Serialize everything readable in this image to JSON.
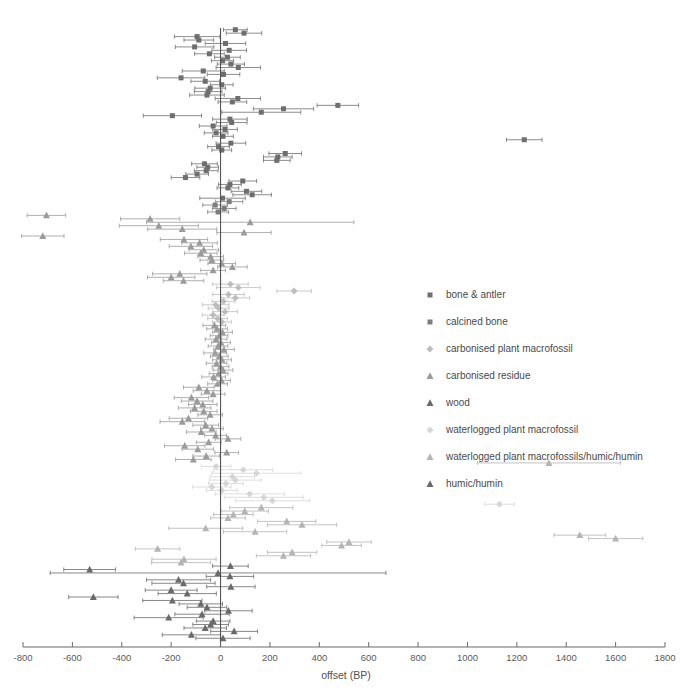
{
  "chart_data": {
    "type": "scatter",
    "title": "",
    "subtitle": "",
    "xlabel": "offset (BP)",
    "ylabel": "",
    "xlim": [
      -800,
      1800
    ],
    "ylim": [
      0,
      190
    ],
    "grid": false,
    "orientation": "forest-plot-horizontal-error-bars",
    "reference_line": {
      "x": 0,
      "label": "zero offset"
    },
    "xticks": [
      -800,
      -600,
      -400,
      -200,
      0,
      200,
      400,
      600,
      800,
      1000,
      1200,
      1400,
      1600,
      1800
    ],
    "xtick_labels": [
      "-800",
      "-600",
      "-400",
      "-200",
      "0",
      "200",
      "400",
      "600",
      "800",
      "1000",
      "1200",
      "1400",
      "1600",
      "1800"
    ],
    "legend_position": "right-middle",
    "series": [
      {
        "name": "bone & antler",
        "marker": "square",
        "color": "#6e6e6e"
      },
      {
        "name": "calcined bone",
        "marker": "square",
        "color": "#7d7d7d"
      },
      {
        "name": "carbonised plant macrofossil",
        "marker": "diamond",
        "color": "#bdbdbd"
      },
      {
        "name": "carbonised residue",
        "marker": "triangle",
        "color": "#9b9b9b"
      },
      {
        "name": "wood",
        "marker": "triangle",
        "color": "#6a6a6a"
      },
      {
        "name": "waterlogged plant macrofossil",
        "marker": "diamond",
        "color": "#d5d5d5"
      },
      {
        "name": "waterlogged plant macrofossils/humic/humin",
        "marker": "triangle",
        "color": "#b4b4b4"
      },
      {
        "name": "humic/humin",
        "marker": "triangle",
        "color": "#6a6a6a"
      }
    ],
    "points": [
      {
        "x": 60,
        "err": 48,
        "s": 0
      },
      {
        "x": 95,
        "err": 72,
        "s": 0
      },
      {
        "x": -95,
        "err": 92,
        "s": 0
      },
      {
        "x": -88,
        "err": 60,
        "s": 0
      },
      {
        "x": 20,
        "err": 82,
        "s": 0
      },
      {
        "x": -105,
        "err": 78,
        "s": 0
      },
      {
        "x": 35,
        "err": 70,
        "s": 0
      },
      {
        "x": -45,
        "err": 60,
        "s": 0
      },
      {
        "x": 28,
        "err": 52,
        "s": 0
      },
      {
        "x": 8,
        "err": 45,
        "s": 0
      },
      {
        "x": 42,
        "err": 55,
        "s": 0
      },
      {
        "x": 72,
        "err": 90,
        "s": 0
      },
      {
        "x": -70,
        "err": 85,
        "s": 0
      },
      {
        "x": 12,
        "err": 66,
        "s": 0
      },
      {
        "x": -160,
        "err": 96,
        "s": 0
      },
      {
        "x": -62,
        "err": 58,
        "s": 0
      },
      {
        "x": 5,
        "err": 46,
        "s": 0
      },
      {
        "x": -42,
        "err": 62,
        "s": 0
      },
      {
        "x": -50,
        "err": 56,
        "s": 0
      },
      {
        "x": -55,
        "err": 70,
        "s": 0
      },
      {
        "x": 70,
        "err": 92,
        "s": 0
      },
      {
        "x": 48,
        "err": 58,
        "s": 0
      },
      {
        "x": 475,
        "err": 84,
        "s": 0
      },
      {
        "x": 255,
        "err": 122,
        "s": 0
      },
      {
        "x": 165,
        "err": 160,
        "s": 0
      },
      {
        "x": -195,
        "err": 118,
        "s": 0
      },
      {
        "x": 38,
        "err": 70,
        "s": 0
      },
      {
        "x": 45,
        "err": 62,
        "s": 0
      },
      {
        "x": -30,
        "err": 56,
        "s": 0
      },
      {
        "x": 18,
        "err": 50,
        "s": 0
      },
      {
        "x": -18,
        "err": 48,
        "s": 0
      },
      {
        "x": 10,
        "err": 42,
        "s": 0
      },
      {
        "x": 1230,
        "err": 72,
        "s": 0
      },
      {
        "x": 42,
        "err": 60,
        "s": 0
      },
      {
        "x": -8,
        "err": 44,
        "s": 0
      },
      {
        "x": 5,
        "err": 40,
        "s": 0
      },
      {
        "x": 262,
        "err": 66,
        "s": 0
      },
      {
        "x": 232,
        "err": 58,
        "s": 0
      },
      {
        "x": 228,
        "err": 54,
        "s": 0
      },
      {
        "x": -65,
        "err": 52,
        "s": 0
      },
      {
        "x": -52,
        "err": 44,
        "s": 0
      },
      {
        "x": -58,
        "err": 48,
        "s": 0
      },
      {
        "x": -95,
        "err": 46,
        "s": 0
      },
      {
        "x": -142,
        "err": 58,
        "s": 0
      },
      {
        "x": 90,
        "err": 56,
        "s": 0
      },
      {
        "x": 38,
        "err": 46,
        "s": 0
      },
      {
        "x": 30,
        "err": 44,
        "s": 0
      },
      {
        "x": 105,
        "err": 62,
        "s": 0
      },
      {
        "x": 128,
        "err": 78,
        "s": 0
      },
      {
        "x": 8,
        "err": 92,
        "s": 0
      },
      {
        "x": 35,
        "err": 55,
        "s": 1
      },
      {
        "x": -22,
        "err": 50,
        "s": 1
      },
      {
        "x": 15,
        "err": 48,
        "s": 1
      },
      {
        "x": -10,
        "err": 42,
        "s": 1
      },
      {
        "x": -705,
        "err": 78,
        "s": 3
      },
      {
        "x": -285,
        "err": 120,
        "s": 3
      },
      {
        "x": 120,
        "err": 420,
        "s": 3
      },
      {
        "x": -250,
        "err": 160,
        "s": 3
      },
      {
        "x": -155,
        "err": 140,
        "s": 3
      },
      {
        "x": 95,
        "err": 110,
        "s": 3
      },
      {
        "x": -720,
        "err": 86,
        "s": 3
      },
      {
        "x": -148,
        "err": 96,
        "s": 3
      },
      {
        "x": -85,
        "err": 72,
        "s": 3
      },
      {
        "x": -120,
        "err": 88,
        "s": 3
      },
      {
        "x": -68,
        "err": 60,
        "s": 3
      },
      {
        "x": -80,
        "err": 66,
        "s": 3
      },
      {
        "x": -40,
        "err": 52,
        "s": 3
      },
      {
        "x": -35,
        "err": 48,
        "s": 3
      },
      {
        "x": 5,
        "err": 56,
        "s": 3
      },
      {
        "x": 48,
        "err": 60,
        "s": 3
      },
      {
        "x": -30,
        "err": 50,
        "s": 3
      },
      {
        "x": -165,
        "err": 110,
        "s": 3
      },
      {
        "x": -200,
        "err": 96,
        "s": 3
      },
      {
        "x": -150,
        "err": 82,
        "s": 3
      },
      {
        "x": 40,
        "err": 72,
        "s": 2
      },
      {
        "x": 72,
        "err": 88,
        "s": 2
      },
      {
        "x": 298,
        "err": 70,
        "s": 2
      },
      {
        "x": 32,
        "err": 64,
        "s": 2
      },
      {
        "x": 60,
        "err": 58,
        "s": 2
      },
      {
        "x": 12,
        "err": 46,
        "s": 2
      },
      {
        "x": -20,
        "err": 54,
        "s": 2
      },
      {
        "x": -8,
        "err": 42,
        "s": 2
      },
      {
        "x": 18,
        "err": 50,
        "s": 2
      },
      {
        "x": -30,
        "err": 44,
        "s": 2
      },
      {
        "x": -12,
        "err": 40,
        "s": 2
      },
      {
        "x": 5,
        "err": 38,
        "s": 2
      },
      {
        "x": -25,
        "err": 46,
        "s": 3
      },
      {
        "x": -14,
        "err": 42,
        "s": 3
      },
      {
        "x": 8,
        "err": 40,
        "s": 3
      },
      {
        "x": -6,
        "err": 36,
        "s": 3
      },
      {
        "x": -18,
        "err": 44,
        "s": 3
      },
      {
        "x": 2,
        "err": 38,
        "s": 3
      },
      {
        "x": -10,
        "err": 40,
        "s": 3
      },
      {
        "x": 14,
        "err": 42,
        "s": 3
      },
      {
        "x": -22,
        "err": 46,
        "s": 3
      },
      {
        "x": -5,
        "err": 36,
        "s": 3
      },
      {
        "x": 6,
        "err": 38,
        "s": 3
      },
      {
        "x": -16,
        "err": 42,
        "s": 3
      },
      {
        "x": 0,
        "err": 34,
        "s": 3
      },
      {
        "x": 10,
        "err": 40,
        "s": 3
      },
      {
        "x": -8,
        "err": 38,
        "s": 3
      },
      {
        "x": -28,
        "err": 48,
        "s": 3
      },
      {
        "x": 4,
        "err": 36,
        "s": 3
      },
      {
        "x": -12,
        "err": 40,
        "s": 3
      },
      {
        "x": -88,
        "err": 62,
        "s": 3
      },
      {
        "x": -55,
        "err": 56,
        "s": 3
      },
      {
        "x": -30,
        "err": 48,
        "s": 3
      },
      {
        "x": -118,
        "err": 70,
        "s": 3
      },
      {
        "x": -95,
        "err": 64,
        "s": 3
      },
      {
        "x": -72,
        "err": 58,
        "s": 3
      },
      {
        "x": -105,
        "err": 66,
        "s": 3
      },
      {
        "x": -68,
        "err": 54,
        "s": 3
      },
      {
        "x": -42,
        "err": 50,
        "s": 3
      },
      {
        "x": -130,
        "err": 78,
        "s": 3
      },
      {
        "x": -155,
        "err": 90,
        "s": 3
      },
      {
        "x": -60,
        "err": 52,
        "s": 3
      },
      {
        "x": -35,
        "err": 46,
        "s": 3
      },
      {
        "x": -78,
        "err": 60,
        "s": 3
      },
      {
        "x": -20,
        "err": 44,
        "s": 3
      },
      {
        "x": 30,
        "err": 52,
        "s": 3
      },
      {
        "x": -48,
        "err": 50,
        "s": 3
      },
      {
        "x": -145,
        "err": 82,
        "s": 3
      },
      {
        "x": -92,
        "err": 64,
        "s": 3
      },
      {
        "x": 25,
        "err": 48,
        "s": 3
      },
      {
        "x": -58,
        "err": 54,
        "s": 3
      },
      {
        "x": -110,
        "err": 72,
        "s": 3
      },
      {
        "x": 1330,
        "err": 290,
        "s": 6
      },
      {
        "x": -18,
        "err": 60,
        "s": 5
      },
      {
        "x": 92,
        "err": 120,
        "s": 5
      },
      {
        "x": 145,
        "err": 180,
        "s": 5
      },
      {
        "x": 48,
        "err": 90,
        "s": 5
      },
      {
        "x": 60,
        "err": 105,
        "s": 5
      },
      {
        "x": 22,
        "err": 70,
        "s": 5
      },
      {
        "x": -35,
        "err": 78,
        "s": 5
      },
      {
        "x": 5,
        "err": 62,
        "s": 5
      },
      {
        "x": 118,
        "err": 140,
        "s": 5
      },
      {
        "x": 175,
        "err": 160,
        "s": 5
      },
      {
        "x": 210,
        "err": 150,
        "s": 5
      },
      {
        "x": 1130,
        "err": 60,
        "s": 5
      },
      {
        "x": 165,
        "err": 128,
        "s": 6
      },
      {
        "x": 98,
        "err": 96,
        "s": 6
      },
      {
        "x": 52,
        "err": 80,
        "s": 6
      },
      {
        "x": 30,
        "err": 70,
        "s": 6
      },
      {
        "x": 268,
        "err": 118,
        "s": 6
      },
      {
        "x": 330,
        "err": 140,
        "s": 6
      },
      {
        "x": -60,
        "err": 150,
        "s": 6
      },
      {
        "x": 140,
        "err": 128,
        "s": 6
      },
      {
        "x": 1455,
        "err": 105,
        "s": 6
      },
      {
        "x": 1600,
        "err": 110,
        "s": 6
      },
      {
        "x": 520,
        "err": 90,
        "s": 6
      },
      {
        "x": 490,
        "err": 80,
        "s": 6
      },
      {
        "x": -255,
        "err": 90,
        "s": 6
      },
      {
        "x": 290,
        "err": 100,
        "s": 6
      },
      {
        "x": 255,
        "err": 110,
        "s": 6
      },
      {
        "x": -148,
        "err": 130,
        "s": 6
      },
      {
        "x": -160,
        "err": 120,
        "s": 6
      },
      {
        "x": 40,
        "err": 72,
        "s": 7
      },
      {
        "x": -530,
        "err": 105,
        "s": 7
      },
      {
        "x": -10,
        "err": 680,
        "s": 7
      },
      {
        "x": 38,
        "err": 96,
        "s": 7
      },
      {
        "x": -170,
        "err": 130,
        "s": 7
      },
      {
        "x": -150,
        "err": 128,
        "s": 7
      },
      {
        "x": 42,
        "err": 98,
        "s": 7
      },
      {
        "x": -200,
        "err": 105,
        "s": 7
      },
      {
        "x": -135,
        "err": 118,
        "s": 7
      },
      {
        "x": -515,
        "err": 100,
        "s": 7
      },
      {
        "x": -195,
        "err": 120,
        "s": 7
      },
      {
        "x": -80,
        "err": 88,
        "s": 7
      },
      {
        "x": -55,
        "err": 80,
        "s": 7
      },
      {
        "x": 32,
        "err": 96,
        "s": 7
      },
      {
        "x": -75,
        "err": 110,
        "s": 7
      },
      {
        "x": -210,
        "err": 140,
        "s": 7
      },
      {
        "x": -30,
        "err": 68,
        "s": 7
      },
      {
        "x": -40,
        "err": 72,
        "s": 7
      },
      {
        "x": -62,
        "err": 86,
        "s": 7
      },
      {
        "x": 55,
        "err": 95,
        "s": 7
      },
      {
        "x": -118,
        "err": 118,
        "s": 7
      },
      {
        "x": 10,
        "err": 110,
        "s": 7
      }
    ]
  },
  "legend": {
    "items": [
      {
        "label": "bone & antler",
        "marker": "square",
        "color": "#6e6e6e"
      },
      {
        "label": "calcined bone",
        "marker": "square",
        "color": "#7d7d7d"
      },
      {
        "label": "carbonised plant macrofossil",
        "marker": "diamond",
        "color": "#bdbdbd"
      },
      {
        "label": "carbonised residue",
        "marker": "triangle",
        "color": "#9b9b9b"
      },
      {
        "label": "wood",
        "marker": "triangle",
        "color": "#6a6a6a"
      },
      {
        "label": "waterlogged plant macrofossil",
        "marker": "diamond",
        "color": "#d5d5d5"
      },
      {
        "label": "waterlogged plant macrofossils/humic/humin",
        "marker": "triangle",
        "color": "#b4b4b4"
      },
      {
        "label": "humic/humin",
        "marker": "triangle",
        "color": "#6a6a6a"
      }
    ]
  }
}
